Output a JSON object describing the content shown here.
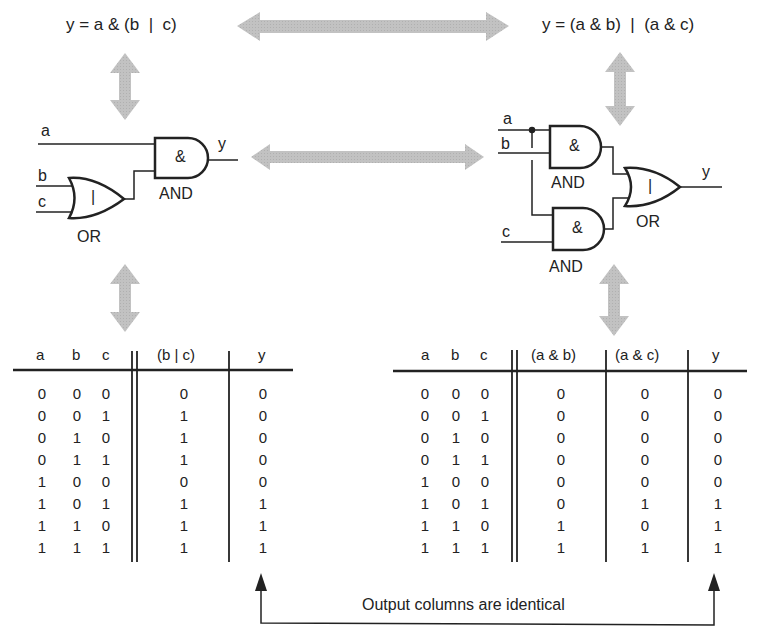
{
  "equations": {
    "left": "y = a & (b  |  c)",
    "right": "y = (a & b)  |  (a & c)"
  },
  "circuit_left": {
    "inputs": [
      "a",
      "b",
      "c"
    ],
    "output": "y",
    "gates": [
      {
        "type": "OR",
        "symbol": "|",
        "label": "OR"
      },
      {
        "type": "AND",
        "symbol": "&",
        "label": "AND"
      }
    ]
  },
  "circuit_right": {
    "inputs": [
      "a",
      "b",
      "c"
    ],
    "output": "y",
    "gates": [
      {
        "type": "AND",
        "symbol": "&",
        "label": "AND"
      },
      {
        "type": "AND",
        "symbol": "&",
        "label": "AND"
      },
      {
        "type": "OR",
        "symbol": "|",
        "label": "OR"
      }
    ]
  },
  "table_left": {
    "headers": [
      "a",
      "b",
      "c",
      "(b | c)",
      "y"
    ],
    "rows": [
      [
        "0",
        "0",
        "0",
        "0",
        "0"
      ],
      [
        "0",
        "0",
        "1",
        "1",
        "0"
      ],
      [
        "0",
        "1",
        "0",
        "1",
        "0"
      ],
      [
        "0",
        "1",
        "1",
        "1",
        "0"
      ],
      [
        "1",
        "0",
        "0",
        "0",
        "0"
      ],
      [
        "1",
        "0",
        "1",
        "1",
        "1"
      ],
      [
        "1",
        "1",
        "0",
        "1",
        "1"
      ],
      [
        "1",
        "1",
        "1",
        "1",
        "1"
      ]
    ]
  },
  "table_right": {
    "headers": [
      "a",
      "b",
      "c",
      "(a & b)",
      "(a & c)",
      "y"
    ],
    "rows": [
      [
        "0",
        "0",
        "0",
        "0",
        "0",
        "0"
      ],
      [
        "0",
        "0",
        "1",
        "0",
        "0",
        "0"
      ],
      [
        "0",
        "1",
        "0",
        "0",
        "0",
        "0"
      ],
      [
        "0",
        "1",
        "1",
        "0",
        "0",
        "0"
      ],
      [
        "1",
        "0",
        "0",
        "0",
        "0",
        "0"
      ],
      [
        "1",
        "0",
        "1",
        "0",
        "1",
        "1"
      ],
      [
        "1",
        "1",
        "0",
        "1",
        "0",
        "1"
      ],
      [
        "1",
        "1",
        "1",
        "1",
        "1",
        "1"
      ]
    ]
  },
  "annotation": {
    "text": "Output columns are identical"
  },
  "colors": {
    "arrow_gray": "#bdbdbd",
    "line": "#222222"
  }
}
